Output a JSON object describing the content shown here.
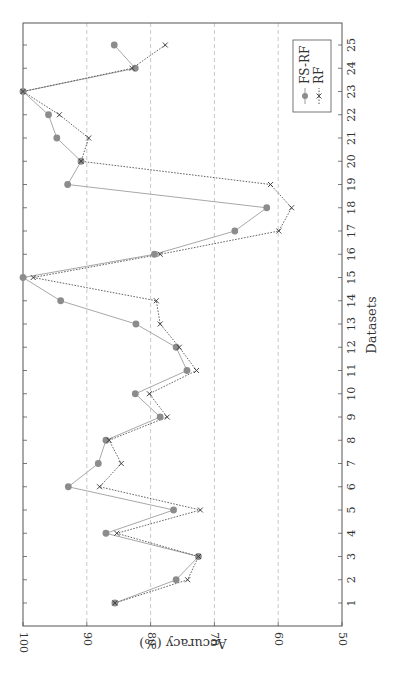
{
  "chart_data": {
    "type": "line",
    "orientation": "rotated-90-clockwise",
    "title": "",
    "xlabel": "Datasets",
    "ylabel": "Accuracy (%)",
    "ylim": [
      50,
      100
    ],
    "yticks": [
      50,
      60,
      70,
      80,
      90,
      100
    ],
    "x": [
      1,
      2,
      3,
      4,
      5,
      6,
      7,
      8,
      9,
      10,
      11,
      12,
      13,
      14,
      15,
      16,
      17,
      18,
      19,
      20,
      21,
      22,
      23,
      24,
      25
    ],
    "grid": "major-y dashed",
    "legend_position": "upper-right (rotated)",
    "series": [
      {
        "name": "FS-RF",
        "marker": "circle",
        "line": "solid",
        "color": "#8c8c8c",
        "values": [
          85.6,
          76.0,
          72.5,
          87.0,
          76.4,
          92.9,
          88.2,
          87.0,
          78.5,
          82.4,
          74.3,
          76.0,
          82.3,
          94.1,
          100.0,
          79.4,
          66.8,
          61.8,
          93.0,
          90.9,
          94.7,
          96.0,
          100.0,
          82.4,
          85.7
        ]
      },
      {
        "name": "RF",
        "marker": "x",
        "line": "dotted",
        "color": "#555555",
        "values": [
          85.6,
          74.2,
          72.5,
          85.3,
          72.2,
          88.0,
          84.6,
          86.5,
          77.4,
          80.2,
          72.8,
          75.5,
          78.5,
          79.1,
          98.4,
          78.5,
          59.9,
          57.9,
          61.2,
          90.9,
          89.7,
          94.3,
          100.0,
          82.9,
          77.7
        ]
      }
    ]
  }
}
